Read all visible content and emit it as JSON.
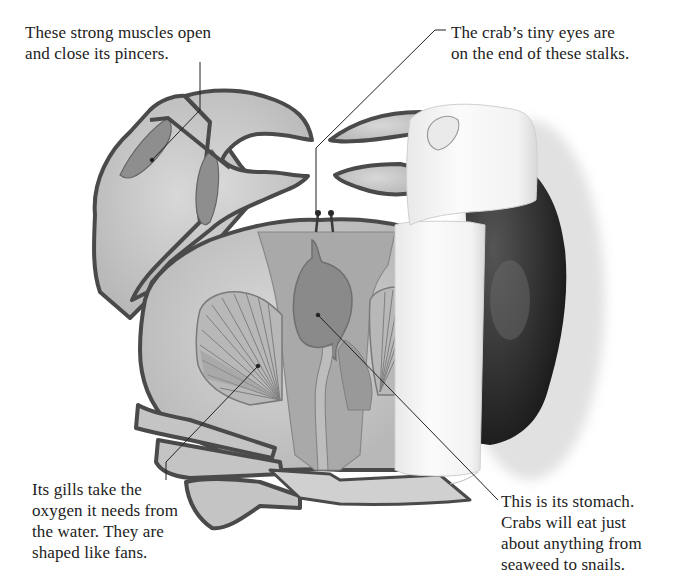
{
  "diagram": {
    "colors": {
      "background": "#ffffff",
      "shell_fill": "#c9c9c9",
      "outline": "#4a4a4a",
      "organ_fill": "#9a9a9a",
      "stomach_fill": "#878787",
      "gill_fill": "#b5b5b5",
      "paper_fill": "#f4f4f4",
      "dark_crab": "#2a2a2a"
    },
    "captions": {
      "muscles": {
        "lines": [
          "These strong muscles open",
          "and close its pincers."
        ]
      },
      "eyes": {
        "lines": [
          "The crab’s tiny eyes are",
          "on the end of these stalks."
        ]
      },
      "gills": {
        "lines": [
          "Its gills take the",
          "oxygen it needs from",
          "the water. They are",
          "shaped like fans."
        ]
      },
      "stomach": {
        "lines": [
          "This is its stomach.",
          "Crabs will eat just",
          "about anything from",
          "seaweed to snails."
        ]
      }
    }
  }
}
